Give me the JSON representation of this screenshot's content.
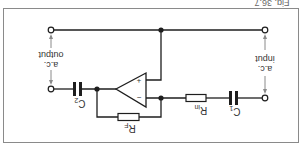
{
  "figure": {
    "caption": "Fig. 36.7",
    "orientation": "rotated 180 degrees (upside down)"
  },
  "labels": {
    "input_line1": "a.c.",
    "input_line2": "input",
    "output_line1": "a.c.",
    "output_line2": "output",
    "c1": "C",
    "c1_sub": "1",
    "c2": "C",
    "c2_sub": "2",
    "rin": "R",
    "rin_sub": "in",
    "rf": "R",
    "rf_sub": "F",
    "plus": "+",
    "minus": "−"
  },
  "colors": {
    "wire": "#1e1e1e",
    "frame": "#8a8a8a",
    "background": "#ffffff"
  }
}
